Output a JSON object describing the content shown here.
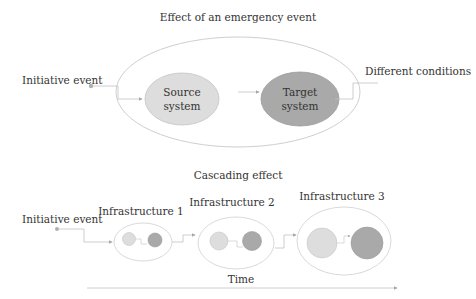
{
  "top_diagram": {
    "title": "Effect of an emergency event",
    "initiative_event": "Initiative event",
    "different_conditions": "Different conditions",
    "source_system": {
      "line1": "Source",
      "line2": "system"
    },
    "target_system": {
      "line1": "Target",
      "line2": "system"
    }
  },
  "bottom_diagram": {
    "title": "Cascading effect",
    "initiative_event": "Initiative event",
    "infrastructures": [
      {
        "label": "Infrastructure 1"
      },
      {
        "label": "Infrastructure 2"
      },
      {
        "label": "Infrastructure 3"
      }
    ],
    "time_label": "Time"
  },
  "colors": {
    "source_fill": "#dddddd",
    "target_fill": "#a9a9a9",
    "outline": "#c8c8c8",
    "connector": "#b5b5b5",
    "text": "#333333"
  }
}
